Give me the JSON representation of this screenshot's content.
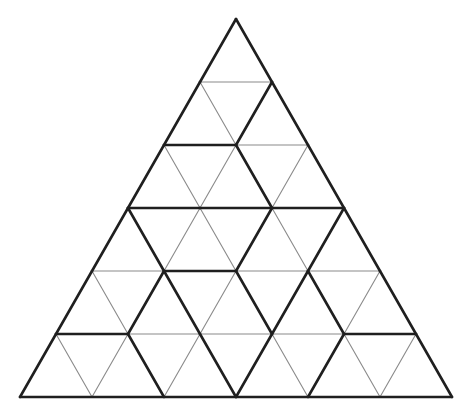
{
  "diagram": {
    "title": "Triangle dissection puzzle",
    "rows": 6,
    "apex": [
      236,
      19
    ],
    "bottom_left": [
      20,
      397
    ],
    "bottom_right": [
      452,
      397
    ],
    "colors": {
      "thin": "#8a8a8a",
      "thick": "#1f1f1f",
      "background": "#ffffff"
    },
    "segments_note": "Each segment uses lattice coords [row, index]; row 0 = apex, index 0..row from left.",
    "horizontal": [
      {
        "row": 1,
        "from": 0,
        "to": 1,
        "w": "thin"
      },
      {
        "row": 2,
        "from": 0,
        "to": 1,
        "w": "thick"
      },
      {
        "row": 2,
        "from": 1,
        "to": 2,
        "w": "thin"
      },
      {
        "row": 3,
        "from": 0,
        "to": 1,
        "w": "thick"
      },
      {
        "row": 3,
        "from": 1,
        "to": 2,
        "w": "thick"
      },
      {
        "row": 3,
        "from": 2,
        "to": 3,
        "w": "thick"
      },
      {
        "row": 4,
        "from": 0,
        "to": 1,
        "w": "thin"
      },
      {
        "row": 4,
        "from": 1,
        "to": 2,
        "w": "thick"
      },
      {
        "row": 4,
        "from": 2,
        "to": 3,
        "w": "thin"
      },
      {
        "row": 4,
        "from": 3,
        "to": 4,
        "w": "thin"
      },
      {
        "row": 5,
        "from": 0,
        "to": 1,
        "w": "thick"
      },
      {
        "row": 5,
        "from": 1,
        "to": 2,
        "w": "thin"
      },
      {
        "row": 5,
        "from": 2,
        "to": 3,
        "w": "thin"
      },
      {
        "row": 5,
        "from": 3,
        "to": 4,
        "w": "thin"
      },
      {
        "row": 5,
        "from": 4,
        "to": 5,
        "w": "thick"
      },
      {
        "row": 6,
        "from": 0,
        "to": 6,
        "w": "thick"
      }
    ],
    "down_left": [
      {
        "row": 0,
        "i": 0,
        "w": "thick"
      },
      {
        "row": 1,
        "i": 0,
        "w": "thick"
      },
      {
        "row": 1,
        "i": 1,
        "w": "thick"
      },
      {
        "row": 2,
        "i": 0,
        "w": "thick"
      },
      {
        "row": 2,
        "i": 1,
        "w": "thin"
      },
      {
        "row": 2,
        "i": 2,
        "w": "thin"
      },
      {
        "row": 3,
        "i": 0,
        "w": "thick"
      },
      {
        "row": 3,
        "i": 1,
        "w": "thin"
      },
      {
        "row": 3,
        "i": 2,
        "w": "thick"
      },
      {
        "row": 3,
        "i": 3,
        "w": "thick"
      },
      {
        "row": 4,
        "i": 0,
        "w": "thick"
      },
      {
        "row": 4,
        "i": 1,
        "w": "thick"
      },
      {
        "row": 4,
        "i": 2,
        "w": "thin"
      },
      {
        "row": 4,
        "i": 3,
        "w": "thick"
      },
      {
        "row": 4,
        "i": 4,
        "w": "thin"
      },
      {
        "row": 5,
        "i": 0,
        "w": "thick"
      },
      {
        "row": 5,
        "i": 1,
        "w": "thin"
      },
      {
        "row": 5,
        "i": 2,
        "w": "thin"
      },
      {
        "row": 5,
        "i": 3,
        "w": "thick"
      },
      {
        "row": 5,
        "i": 4,
        "w": "thick"
      },
      {
        "row": 5,
        "i": 5,
        "w": "thin"
      }
    ],
    "down_right": [
      {
        "row": 0,
        "i": 0,
        "w": "thick"
      },
      {
        "row": 1,
        "i": 0,
        "w": "thin"
      },
      {
        "row": 1,
        "i": 1,
        "w": "thick"
      },
      {
        "row": 2,
        "i": 0,
        "w": "thin"
      },
      {
        "row": 2,
        "i": 1,
        "w": "thick"
      },
      {
        "row": 2,
        "i": 2,
        "w": "thick"
      },
      {
        "row": 3,
        "i": 0,
        "w": "thick"
      },
      {
        "row": 3,
        "i": 1,
        "w": "thin"
      },
      {
        "row": 3,
        "i": 2,
        "w": "thin"
      },
      {
        "row": 3,
        "i": 3,
        "w": "thick"
      },
      {
        "row": 4,
        "i": 0,
        "w": "thin"
      },
      {
        "row": 4,
        "i": 1,
        "w": "thick"
      },
      {
        "row": 4,
        "i": 2,
        "w": "thick"
      },
      {
        "row": 4,
        "i": 3,
        "w": "thick"
      },
      {
        "row": 4,
        "i": 4,
        "w": "thick"
      },
      {
        "row": 5,
        "i": 0,
        "w": "thin"
      },
      {
        "row": 5,
        "i": 1,
        "w": "thick"
      },
      {
        "row": 5,
        "i": 2,
        "w": "thick"
      },
      {
        "row": 5,
        "i": 3,
        "w": "thin"
      },
      {
        "row": 5,
        "i": 4,
        "w": "thin"
      },
      {
        "row": 5,
        "i": 5,
        "w": "thick"
      }
    ]
  }
}
